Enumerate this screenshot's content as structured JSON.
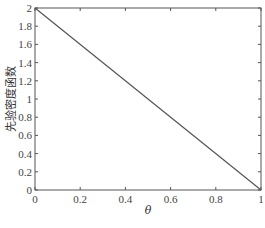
{
  "chart_data": {
    "type": "line",
    "title": "",
    "xlabel": "θ",
    "ylabel": "先验密度函数",
    "xlim": [
      0,
      1
    ],
    "ylim": [
      0,
      2
    ],
    "xticks": [
      0,
      0.2,
      0.4,
      0.6,
      0.8,
      1
    ],
    "xtick_labels": [
      "0",
      "0.2",
      "0.4",
      "0.6",
      "0.8",
      "1"
    ],
    "yticks": [
      0,
      0.2,
      0.4,
      0.6,
      0.8,
      1,
      1.2,
      1.4,
      1.6,
      1.8,
      2
    ],
    "ytick_labels": [
      "0",
      "0.2",
      "0.4",
      "0.6",
      "0.8",
      "1",
      "1.2",
      "1.4",
      "1.6",
      "1.8",
      "2"
    ],
    "grid": false,
    "legend": null,
    "series": [
      {
        "name": "prior density",
        "x": [
          0,
          1
        ],
        "y": [
          2,
          0
        ],
        "color": "#555555"
      }
    ]
  }
}
